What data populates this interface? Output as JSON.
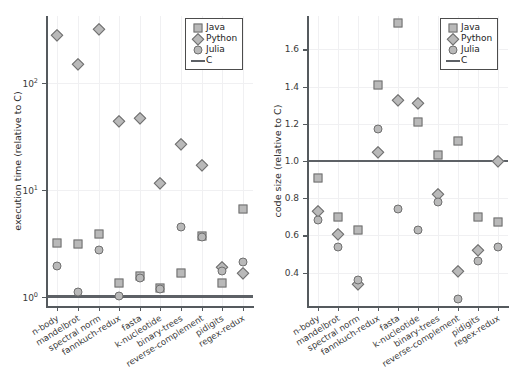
{
  "figure": {
    "width": 519,
    "height": 367,
    "background": "#ffffff",
    "marker_fill": "#b9b9b9",
    "marker_edge": "#6f6f6f",
    "axis_color": "#555a5e",
    "cline_color": "#5d6166",
    "grid_color": "#f0f0f2"
  },
  "legend": {
    "position": "top-right",
    "entries": [
      {
        "label": "Java",
        "symbol": "square"
      },
      {
        "label": "Python",
        "symbol": "diamond"
      },
      {
        "label": "Julia",
        "symbol": "circle"
      },
      {
        "label": "C",
        "symbol": "line"
      }
    ]
  },
  "categories": [
    "n-body",
    "mandelbrot",
    "spectral norm",
    "fannkuch-redux",
    "fasta",
    "k-nucleotide",
    "binary-trees",
    "reverse-complement",
    "pidigits",
    "regex-redux"
  ],
  "chart_data": [
    {
      "id": "execution-time",
      "type": "scatter",
      "title": "",
      "xlabel": "",
      "ylabel": "execution time (relative to C)",
      "yscale": "log",
      "ylim": [
        0.82,
        420
      ],
      "ytick_values": [
        1,
        10,
        100
      ],
      "ytick_labels": [
        "10⁰",
        "10¹",
        "10²"
      ],
      "grid": true,
      "legend_position": "top-right",
      "reference_line": {
        "name": "C",
        "value": 1.0
      },
      "categories": [
        "n-body",
        "mandelbrot",
        "spectral norm",
        "fannkuch-redux",
        "fasta",
        "k-nucleotide",
        "binary-trees",
        "reverse-complement",
        "pidigits",
        "regex-redux"
      ],
      "series": [
        {
          "name": "Java",
          "symbol": "square",
          "values": [
            3.2,
            3.1,
            3.9,
            1.35,
            1.55,
            1.22,
            1.65,
            3.7,
            1.35,
            6.6
          ]
        },
        {
          "name": "Python",
          "symbol": "diamond",
          "values": [
            280,
            150,
            320,
            44,
            47,
            11.5,
            27,
            17,
            1.9,
            1.65
          ]
        },
        {
          "name": "Julia",
          "symbol": "circle",
          "values": [
            1.95,
            1.1,
            2.75,
            1.02,
            1.5,
            1.18,
            4.5,
            3.6,
            1.75,
            2.1
          ]
        },
        {
          "name": "C",
          "symbol": "line",
          "values": [
            1,
            1,
            1,
            1,
            1,
            1,
            1,
            1,
            1,
            1
          ]
        }
      ]
    },
    {
      "id": "code-size",
      "type": "scatter",
      "title": "",
      "xlabel": "",
      "ylabel": "code size (relative to C)",
      "yscale": "linear",
      "ylim": [
        0.22,
        1.78
      ],
      "ytick_values": [
        0.4,
        0.6,
        0.8,
        1.0,
        1.2,
        1.4,
        1.6
      ],
      "ytick_labels": [
        "0.4",
        "0.6",
        "0.8",
        "1.0",
        "1.2",
        "1.4",
        "1.6"
      ],
      "grid": true,
      "legend_position": "top-right",
      "reference_line": {
        "name": "C",
        "value": 1.0
      },
      "categories": [
        "n-body",
        "mandelbrot",
        "spectral norm",
        "fannkuch-redux",
        "fasta",
        "k-nucleotide",
        "binary-trees",
        "reverse-complement",
        "pidigits",
        "regex-redux"
      ],
      "series": [
        {
          "name": "Java",
          "symbol": "square",
          "values": [
            0.91,
            0.7,
            0.63,
            1.41,
            1.74,
            1.21,
            1.03,
            1.11,
            0.7,
            0.67
          ]
        },
        {
          "name": "Python",
          "symbol": "diamond",
          "values": [
            0.73,
            0.61,
            0.34,
            1.05,
            1.33,
            1.31,
            0.82,
            0.41,
            0.52,
            1.0
          ]
        },
        {
          "name": "Julia",
          "symbol": "circle",
          "values": [
            0.68,
            0.54,
            0.36,
            1.17,
            0.74,
            0.63,
            0.78,
            0.26,
            0.46,
            0.54
          ]
        },
        {
          "name": "C",
          "symbol": "line",
          "values": [
            1,
            1,
            1,
            1,
            1,
            1,
            1,
            1,
            1,
            1
          ]
        }
      ]
    }
  ]
}
